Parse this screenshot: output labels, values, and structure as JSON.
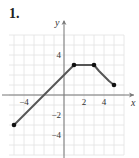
{
  "problem": {
    "number": "1."
  },
  "colors": {
    "grid": "#e2e2e2",
    "axis": "#777777",
    "curve": "#555555",
    "point": "#111111",
    "text": "#333333"
  },
  "chart_data": {
    "type": "line",
    "title": "",
    "xlabel": "x",
    "ylabel": "y",
    "xlim": [
      -6,
      6
    ],
    "ylim": [
      -6,
      6
    ],
    "grid": true,
    "x_ticks": [
      -4,
      2,
      4
    ],
    "y_ticks": [
      4,
      -2,
      -4
    ],
    "series": [
      {
        "name": "f",
        "segments": [
          {
            "kind": "line",
            "points": [
              [
                -5,
                -3
              ],
              [
                1,
                3
              ]
            ]
          },
          {
            "kind": "line",
            "points": [
              [
                1,
                3
              ],
              [
                3,
                3
              ]
            ]
          },
          {
            "kind": "curve",
            "points": [
              [
                3,
                3
              ],
              [
                3.5,
                2.4
              ],
              [
                4,
                1.9
              ],
              [
                4.5,
                1.4
              ],
              [
                5,
                1
              ]
            ]
          }
        ],
        "endpoints": [
          [
            -5,
            -3
          ],
          [
            1,
            3
          ],
          [
            3,
            3
          ],
          [
            5,
            1
          ]
        ]
      }
    ]
  }
}
